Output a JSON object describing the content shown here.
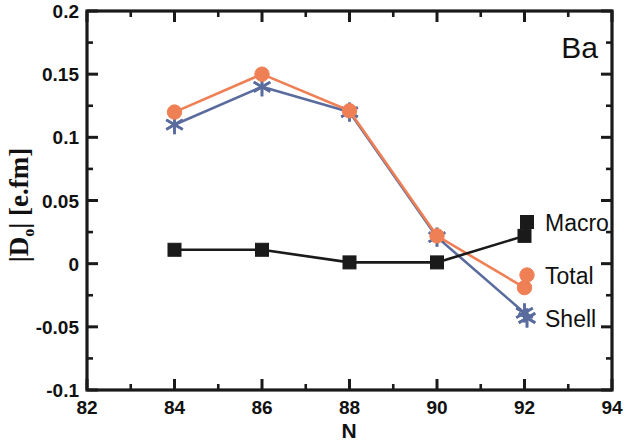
{
  "chart_data": {
    "type": "line",
    "title": "",
    "annotation": "Ba",
    "xlabel": "N",
    "ylabel": "|D₀| [e.fm]",
    "ylabel_main": "|D",
    "ylabel_sub": "o",
    "ylabel_tail": "| [e.fm]",
    "x": [
      84,
      86,
      88,
      90,
      92
    ],
    "xlim": [
      82,
      94
    ],
    "ylim": [
      -0.1,
      0.2
    ],
    "xticks": [
      82,
      84,
      86,
      88,
      90,
      92,
      94
    ],
    "xtick_labels": [
      "82",
      "84",
      "86",
      "88",
      "90",
      "92",
      "94"
    ],
    "x_minor_ticks": [
      83,
      85,
      87,
      89,
      91,
      93
    ],
    "yticks": [
      -0.1,
      -0.05,
      0,
      0.05,
      0.1,
      0.15,
      0.2
    ],
    "ytick_labels": [
      "-0.1",
      "-0.05",
      "0",
      "0.05",
      "0.1",
      "0.15",
      "0.2"
    ],
    "y_minor_ticks": [
      -0.075,
      -0.025,
      0.025,
      0.075,
      0.125,
      0.175
    ],
    "grid": false,
    "legend_position": "right-inline",
    "series": [
      {
        "name": "Macro",
        "label": "Macro",
        "color": "#1a1a1a",
        "marker": "square",
        "values": [
          0.011,
          0.011,
          0.001,
          0.001,
          0.022
        ]
      },
      {
        "name": "Total",
        "label": "Total",
        "color": "#ef8055",
        "marker": "circle",
        "values": [
          0.12,
          0.15,
          0.121,
          0.022,
          -0.019
        ]
      },
      {
        "name": "Shell",
        "label": "Shell",
        "color": "#5a6b9e",
        "marker": "asterisk",
        "values": [
          0.11,
          0.14,
          0.12,
          0.021,
          -0.039
        ]
      }
    ]
  },
  "figure": {
    "background": "#ffffff",
    "axis_color": "#1a1a1a",
    "element_label": "Ba"
  }
}
